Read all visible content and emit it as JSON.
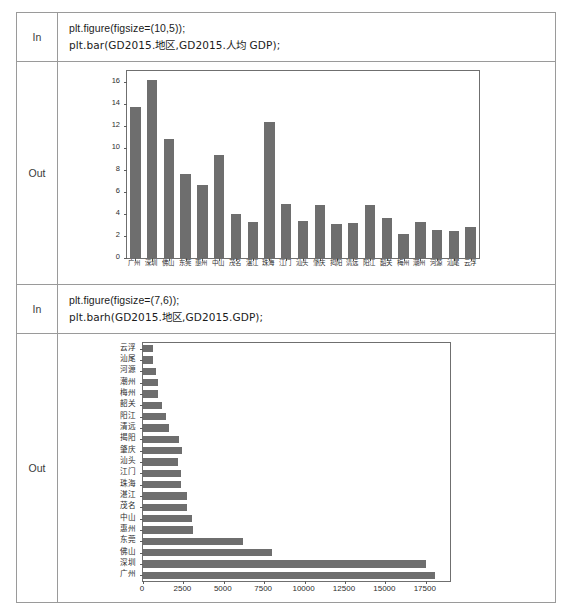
{
  "cells": [
    {
      "label": "In",
      "code_lines": [
        "plt.figure(figsize=(10,5));",
        "plt.bar(GD2015.地区,GD2015.人均 GDP);"
      ]
    },
    {
      "label": "Out"
    },
    {
      "label": "In",
      "code_lines": [
        "plt.figure(figsize=(7,6));",
        "plt.barh(GD2015.地区,GD2015.GDP);"
      ]
    },
    {
      "label": "Out"
    }
  ],
  "labels": {
    "in": "In",
    "out": "Out",
    "cell1_line1": "plt.figure(figsize=(10,5));",
    "cell1_line2": "plt.bar(GD2015.地区,GD2015.人均 GDP);",
    "cell2_line1": "plt.figure(figsize=(7,6));",
    "cell2_line2": "plt.barh(GD2015.地区,GD2015.GDP);"
  },
  "colors": {
    "bar": "#6e6e6e",
    "axis": "#6f6f6f",
    "table_border": "#9a9a9a",
    "text": "#231f20"
  },
  "chart_data": [
    {
      "type": "bar",
      "orientation": "vertical",
      "title": "",
      "xlabel": "",
      "ylabel": "",
      "ylim": [
        0,
        17
      ],
      "yticks": [
        0,
        2,
        4,
        6,
        8,
        10,
        12,
        14,
        16
      ],
      "grid": false,
      "legend": false,
      "categories": [
        "广州",
        "深圳",
        "佛山",
        "东莞",
        "惠州",
        "中山",
        "茂名",
        "湛江",
        "珠海",
        "江门",
        "汕头",
        "肇庆",
        "揭阳",
        "清远",
        "阳江",
        "韶关",
        "梅州",
        "潮州",
        "河源",
        "汕尾",
        "云浮"
      ],
      "values": [
        13.7,
        16.2,
        10.8,
        7.6,
        6.6,
        9.35,
        4.0,
        3.25,
        12.35,
        4.95,
        3.35,
        4.8,
        3.05,
        3.2,
        4.85,
        3.6,
        2.15,
        3.3,
        2.55,
        2.45,
        2.85
      ]
    },
    {
      "type": "bar",
      "orientation": "horizontal",
      "title": "",
      "xlabel": "",
      "ylabel": "",
      "xlim": [
        0,
        19000
      ],
      "xticks": [
        0,
        2500,
        5000,
        7500,
        10000,
        12500,
        15000,
        17500
      ],
      "grid": false,
      "legend": false,
      "categories": [
        "广州",
        "深圳",
        "佛山",
        "东莞",
        "惠州",
        "中山",
        "茂名",
        "湛江",
        "珠海",
        "江门",
        "汕头",
        "肇庆",
        "揭阳",
        "清远",
        "阳江",
        "韶关",
        "梅州",
        "潮州",
        "河源",
        "汕尾",
        "云浮"
      ],
      "values": [
        18100,
        17500,
        8000,
        6200,
        3100,
        3010,
        2750,
        2700,
        2350,
        2350,
        2150,
        2400,
        2250,
        1600,
        1450,
        1200,
        950,
        900,
        800,
        600,
        600
      ]
    }
  ]
}
